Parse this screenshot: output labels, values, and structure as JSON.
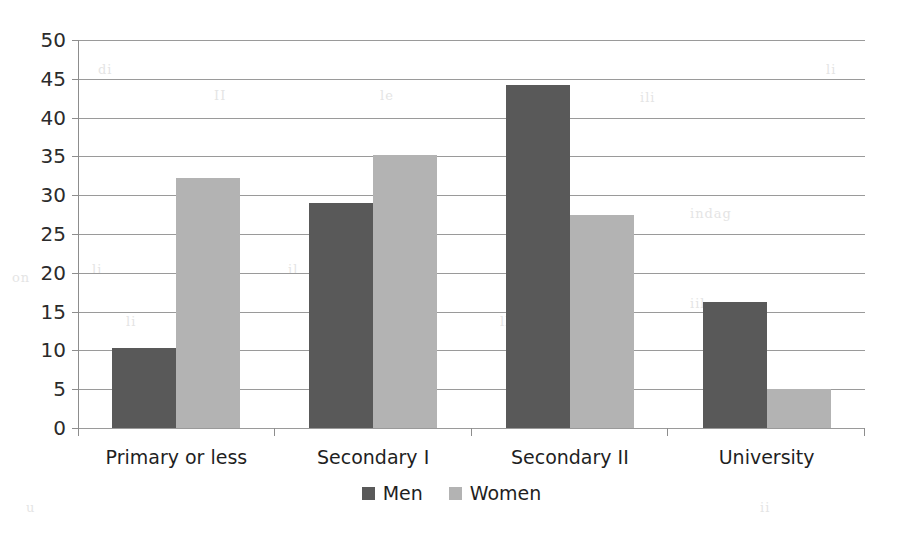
{
  "chart_data": {
    "type": "bar",
    "title": "",
    "subtitle": "",
    "xlabel": "",
    "ylabel": "",
    "categories": [
      "Primary or less",
      "Secondary I",
      "Secondary II",
      "University"
    ],
    "series": [
      {
        "name": "Men",
        "color": "#595959",
        "values": [
          10.3,
          29.0,
          44.2,
          16.2
        ]
      },
      {
        "name": "Women",
        "color": "#b3b3b3",
        "values": [
          32.2,
          35.2,
          27.4,
          5.0
        ]
      }
    ],
    "ylim": [
      0,
      50
    ],
    "ytick_step": 5,
    "yticks": [
      50,
      45,
      40,
      35,
      30,
      25,
      20,
      15,
      10,
      5,
      0
    ],
    "ytick_labels": [
      "50",
      "45",
      "40",
      "35",
      "30",
      "25",
      "20",
      "15",
      "10",
      "5",
      "0"
    ],
    "grid": true,
    "grid_axis": "y",
    "legend_position": "bottom",
    "legend": [
      "Men",
      "Women"
    ],
    "annotations": []
  },
  "colors": {
    "men": "#595959",
    "women": "#b3b3b3",
    "gridline": "#9a9a9a",
    "axis": "#8d8d8d",
    "text": "#1f1f1f",
    "background": "#ffffff"
  },
  "background_scan_text": [
    {
      "text": "di",
      "x": 98,
      "y": 62
    },
    {
      "text": "II",
      "x": 214,
      "y": 88
    },
    {
      "text": "le",
      "x": 380,
      "y": 88
    },
    {
      "text": "li",
      "x": 826,
      "y": 62
    },
    {
      "text": "ili",
      "x": 640,
      "y": 90
    },
    {
      "text": "indag",
      "x": 690,
      "y": 206
    },
    {
      "text": "li",
      "x": 92,
      "y": 262
    },
    {
      "text": "il",
      "x": 288,
      "y": 262
    },
    {
      "text": "on",
      "x": 12,
      "y": 270
    },
    {
      "text": "an",
      "x": 400,
      "y": 296
    },
    {
      "text": "iil",
      "x": 690,
      "y": 296
    },
    {
      "text": "li",
      "x": 126,
      "y": 314
    },
    {
      "text": "ll",
      "x": 500,
      "y": 314
    },
    {
      "text": "u",
      "x": 26,
      "y": 500
    },
    {
      "text": "ii",
      "x": 760,
      "y": 500
    }
  ]
}
